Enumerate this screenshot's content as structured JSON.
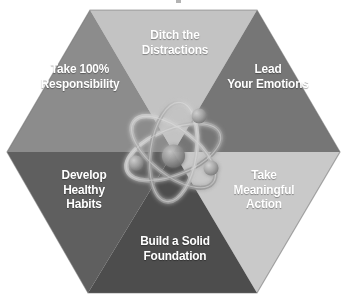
{
  "graphic": {
    "title": "Six-segment hexagon framework with central atom icon",
    "shape": "hexagon",
    "segment_count": 6,
    "center_icon": "atom-icon",
    "text_color": "#ffffff"
  },
  "segments": [
    {
      "id": "ditch-the-distractions",
      "position": "top",
      "label": "Ditch the\nDistractions",
      "lines": [
        "Ditch the",
        "Distractions"
      ],
      "color": "#c3c3c3"
    },
    {
      "id": "take-100-percent-responsibility",
      "position": "upper-left",
      "label": "Take 100%\nResponsibility",
      "lines": [
        "Take 100%",
        "Responsibility"
      ],
      "color": "#8c8c8c"
    },
    {
      "id": "lead-your-emotions",
      "position": "upper-right",
      "label": "Lead\nYour Emotions",
      "lines": [
        "Lead",
        "Your Emotions"
      ],
      "color": "#767676"
    },
    {
      "id": "develop-healthy-habits",
      "position": "lower-left",
      "label": "Develop\nHealthy\nHabits",
      "lines": [
        "Develop",
        "Healthy",
        "Habits"
      ],
      "color": "#5f5f5f"
    },
    {
      "id": "take-meaningful-action",
      "position": "lower-right",
      "label": "Take\nMeaningful\nAction",
      "lines": [
        "Take",
        "Meaningful",
        "Action"
      ],
      "color": "#c9c9c9"
    },
    {
      "id": "build-a-solid-foundation",
      "position": "bottom",
      "label": "Build a Solid\nFoundation",
      "lines": [
        "Build a Solid",
        "Foundation"
      ],
      "color": "#4d4d4d"
    }
  ],
  "atom": {
    "name": "atom-icon",
    "nucleus_color": "#8e8e8e",
    "orbit_color": "#b8b8b8",
    "electron_count": 3,
    "orbit_count": 3
  },
  "colors": {
    "background": "#ffffff",
    "outline": "#707070",
    "label_text": "#ffffff"
  }
}
